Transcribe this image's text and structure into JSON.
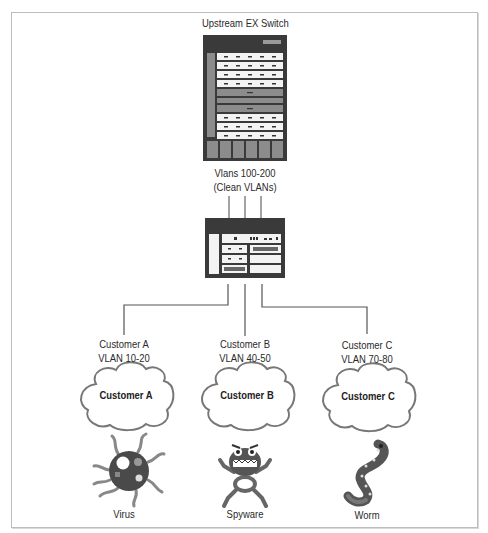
{
  "diagram": {
    "upstream_switch": {
      "title": "Upstream EX Switch",
      "vlans_line1": "Vlans 100-200",
      "vlans_line2": "(Clean VLANs)"
    },
    "access_switch": {
      "label": ""
    },
    "customers": [
      {
        "name_line": "Customer A",
        "vlan_line": "VLAN 10-20",
        "cloud_label": "Customer A",
        "threat_icon": "virus-icon",
        "threat_label": "Virus"
      },
      {
        "name_line": "Customer B",
        "vlan_line": "VLAN 40-50",
        "cloud_label": "Customer B",
        "threat_icon": "spyware-icon",
        "threat_label": "Spyware"
      },
      {
        "name_line": "Customer C",
        "vlan_line": "VLAN 70-80",
        "cloud_label": "Customer C",
        "threat_icon": "worm-icon",
        "threat_label": "Worm"
      }
    ],
    "colors": {
      "line": "#555555",
      "device_dark": "#3a3a3a",
      "device_mid": "#8a8a8a",
      "device_light": "#f2f2f2",
      "cloud_stroke": "#777777",
      "frame": "#bdbdbd"
    }
  }
}
